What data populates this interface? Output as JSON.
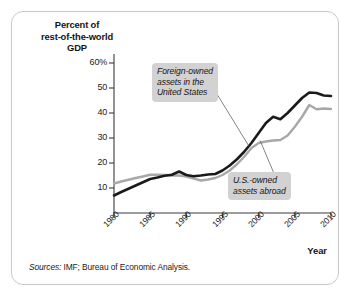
{
  "figure": {
    "axis_title_lines": [
      "Percent of",
      "rest-of-the-world",
      "GDP"
    ],
    "xaxis_label": "Year",
    "source_label": "Sources:",
    "source_text": "IMF; Bureau of Economic Analysis.",
    "frame_color": "#c9c9c9",
    "background": "#ffffff"
  },
  "annotations": [
    {
      "id": "foreign",
      "text_lines": [
        "Foreign-owned",
        "assets in the",
        "United States"
      ],
      "box_color": "#d2d2d2"
    },
    {
      "id": "usowned",
      "text_lines": [
        "U.S.-owned",
        "assets abroad"
      ],
      "box_color": "#d2d2d2"
    }
  ],
  "chart_data": {
    "type": "line",
    "title": "",
    "subtitle": "",
    "xlabel": "Year",
    "ylabel": "Percent of rest-of-the-world GDP",
    "xlim": [
      1980,
      2010
    ],
    "ylim": [
      0,
      60
    ],
    "grid": false,
    "legend_position": "inline-callouts",
    "xticks": [
      1980,
      1985,
      1990,
      1995,
      2000,
      2005,
      2010
    ],
    "xticklabels": [
      "1980",
      "1985",
      "1990",
      "1995",
      "2000",
      "2005",
      "2010"
    ],
    "yticks": [
      10,
      20,
      30,
      40,
      50,
      60
    ],
    "yticklabels": [
      "10",
      "20",
      "30",
      "40",
      "50",
      "60%"
    ],
    "x": [
      1980,
      1981,
      1982,
      1983,
      1984,
      1985,
      1986,
      1987,
      1988,
      1989,
      1990,
      1991,
      1992,
      1993,
      1994,
      1995,
      1996,
      1997,
      1998,
      1999,
      2000,
      2001,
      2002,
      2003,
      2004,
      2005,
      2006,
      2007,
      2008,
      2009,
      2010
    ],
    "series": [
      {
        "name": "Foreign-owned assets in the United States",
        "color": "#1a1a1a",
        "values": [
          7.0,
          8.4,
          9.7,
          11.0,
          12.3,
          13.6,
          14.2,
          14.9,
          15.3,
          16.6,
          15.2,
          14.7,
          15.0,
          15.4,
          15.6,
          17.0,
          19.0,
          21.5,
          24.5,
          28.0,
          32.0,
          36.0,
          38.5,
          37.5,
          40.0,
          43.0,
          46.0,
          48.2,
          48.0,
          47.0,
          46.8
        ]
      },
      {
        "name": "U.S.-owned assets abroad",
        "color": "#a8a8a8",
        "values": [
          11.8,
          12.6,
          13.3,
          14.0,
          14.6,
          15.3,
          15.3,
          15.2,
          15.0,
          15.0,
          14.6,
          13.8,
          13.0,
          13.4,
          14.0,
          15.2,
          17.0,
          19.5,
          22.5,
          26.0,
          28.0,
          28.6,
          29.0,
          29.2,
          31.0,
          34.5,
          38.5,
          43.2,
          41.5,
          41.8,
          41.6
        ]
      }
    ],
    "annotation_targets": [
      {
        "series": "Foreign-owned assets in the United States",
        "leader_from": [
          1993.2,
          52.5
        ],
        "leader_to": [
          1998.6,
          27.0
        ]
      },
      {
        "series": "U.S.-owned assets abroad",
        "leader_from": [
          2002.6,
          12.5
        ],
        "leader_to": [
          2000.2,
          29.0
        ]
      }
    ]
  }
}
